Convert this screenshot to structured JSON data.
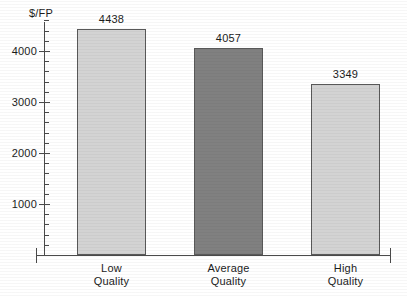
{
  "chart_data": {
    "type": "bar",
    "title": "",
    "subtitle": "",
    "xlabel": "",
    "ylabel": "$/FP",
    "categories": [
      "Low Quality",
      "Average Quality",
      "High Quality"
    ],
    "category_lines": [
      [
        "Low",
        "Quality"
      ],
      [
        "Average",
        "Quality"
      ],
      [
        "High",
        "Quality"
      ]
    ],
    "values": [
      4438,
      4057,
      3349
    ],
    "value_labels": [
      "4438",
      "4057",
      "3349"
    ],
    "bar_colors": [
      "#d3d3d3",
      "#808080",
      "#d3d3d3"
    ],
    "bar_border_color": "#595959",
    "ylim": [
      0,
      4700
    ],
    "ytick_values": [
      1000,
      2000,
      3000,
      4000
    ],
    "ytick_labels": [
      "1000",
      "2000",
      "3000",
      "4000"
    ],
    "minor_tick_step": 200,
    "grid": false,
    "legend": null,
    "axis_color": "#4a4a4a",
    "text_color": "#1c1c1c",
    "background": "#ffffff"
  }
}
